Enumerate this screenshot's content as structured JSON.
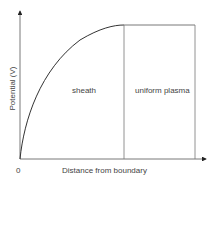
{
  "diagram": {
    "y_axis_label": "Potential (V)",
    "x_axis_label": "Distance from boundary",
    "origin_label": "0",
    "regions": [
      {
        "name": "sheath",
        "label": "sheath"
      },
      {
        "name": "uniform-plasma",
        "label": "uniform plasma"
      }
    ],
    "colors": {
      "line": "#333333",
      "divider": "#777777",
      "text": "#444444"
    }
  }
}
